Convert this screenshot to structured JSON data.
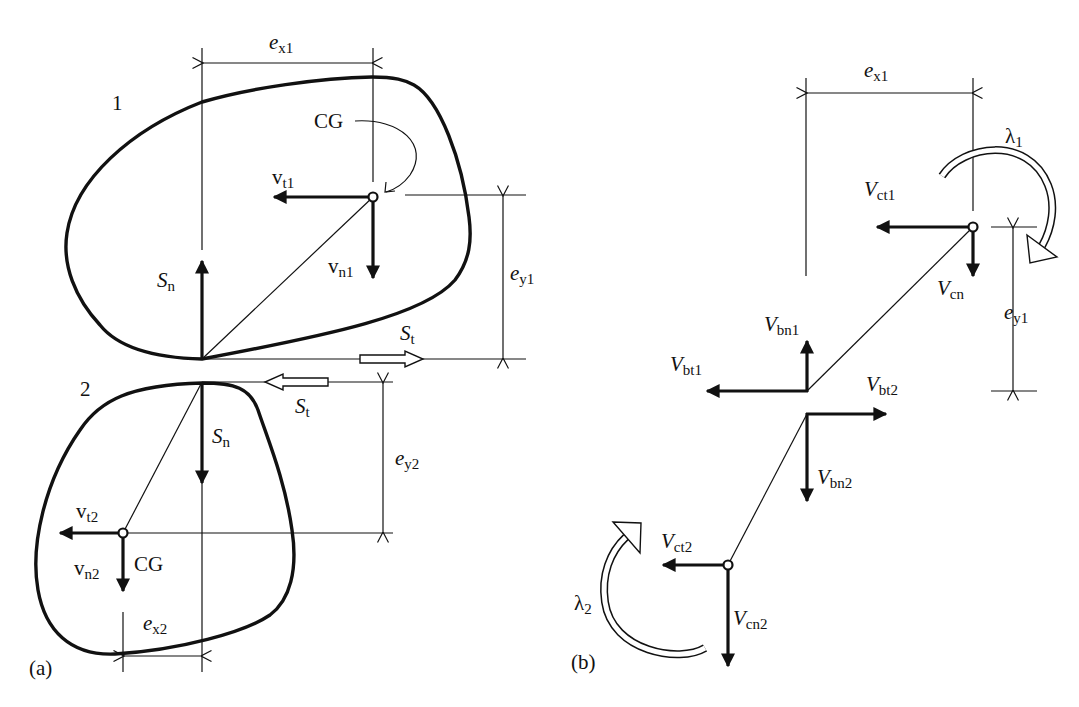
{
  "figure": {
    "panel_a": {
      "panel_label": "(a)",
      "body1": "1",
      "body2": "2",
      "ex1": {
        "main": "e",
        "sub": "x1"
      },
      "cg1": "CG",
      "vt1": {
        "main": "v",
        "sub": "t1"
      },
      "vn1": {
        "main": "v",
        "sub": "n1"
      },
      "sn_upper": {
        "main": "S",
        "sub": "n"
      },
      "ey1": {
        "main": "e",
        "sub": "y1"
      },
      "st_upper": {
        "main": "S",
        "sub": "t"
      },
      "st_lower": {
        "main": "S",
        "sub": "t"
      },
      "sn_lower": {
        "main": "S",
        "sub": "n"
      },
      "ey2": {
        "main": "e",
        "sub": "y2"
      },
      "vt2": {
        "main": "v",
        "sub": "t2"
      },
      "vn2": {
        "main": "v",
        "sub": "n2"
      },
      "cg2": "CG",
      "ex2": {
        "main": "e",
        "sub": "x2"
      }
    },
    "panel_b": {
      "panel_label": "(b)",
      "ex1": {
        "main": "e",
        "sub": "x1"
      },
      "lambda1": {
        "main": "λ",
        "sub": "1"
      },
      "vct1": {
        "main": "V",
        "sub": "ct1"
      },
      "vcn": {
        "main": "V",
        "sub": "cn"
      },
      "ey1": {
        "main": "e",
        "sub": "y1"
      },
      "vbn1": {
        "main": "V",
        "sub": "bn1"
      },
      "vbt1": {
        "main": "V",
        "sub": "bt1"
      },
      "vbt2": {
        "main": "V",
        "sub": "bt2"
      },
      "vbn2": {
        "main": "V",
        "sub": "bn2"
      },
      "vct2": {
        "main": "V",
        "sub": "ct2"
      },
      "lambda2": {
        "main": "λ",
        "sub": "2"
      },
      "vcn2": {
        "main": "V",
        "sub": "cn2"
      }
    },
    "colors": {
      "ink": "#111111",
      "background": "#ffffff"
    }
  }
}
